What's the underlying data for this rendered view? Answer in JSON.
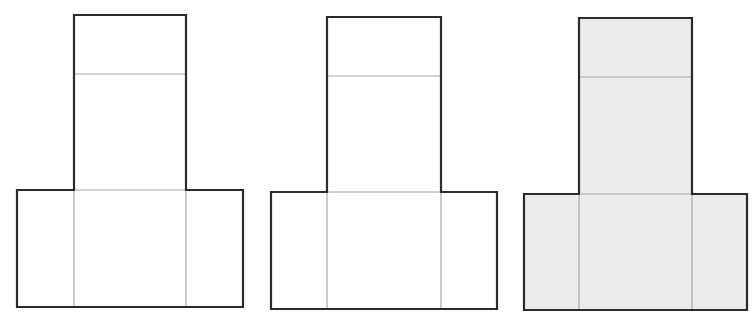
{
  "diagram": {
    "colors": {
      "outline": "#2b2b2b",
      "inner_line": "#a8a8a8",
      "fill_plain": "#ffffff",
      "fill_shaded": "#ececec"
    },
    "shapes": [
      {
        "name": "t-shape-1",
        "fill": "#ffffff",
        "tower": {
          "x1": 74,
          "x2": 186,
          "top": 15,
          "divider": 74
        },
        "base": {
          "x1": 17,
          "x2": 243,
          "top": 190,
          "bottom": 307
        }
      },
      {
        "name": "t-shape-2",
        "fill": "#ffffff",
        "tower": {
          "x1": 327,
          "x2": 441,
          "top": 17,
          "divider": 76
        },
        "base": {
          "x1": 271,
          "x2": 497,
          "top": 192,
          "bottom": 309
        }
      },
      {
        "name": "t-shape-3-shaded",
        "fill": "#ececec",
        "tower": {
          "x1": 579,
          "x2": 692,
          "top": 18,
          "divider": 77
        },
        "base": {
          "x1": 524,
          "x2": 747,
          "top": 194,
          "bottom": 310
        }
      }
    ]
  }
}
